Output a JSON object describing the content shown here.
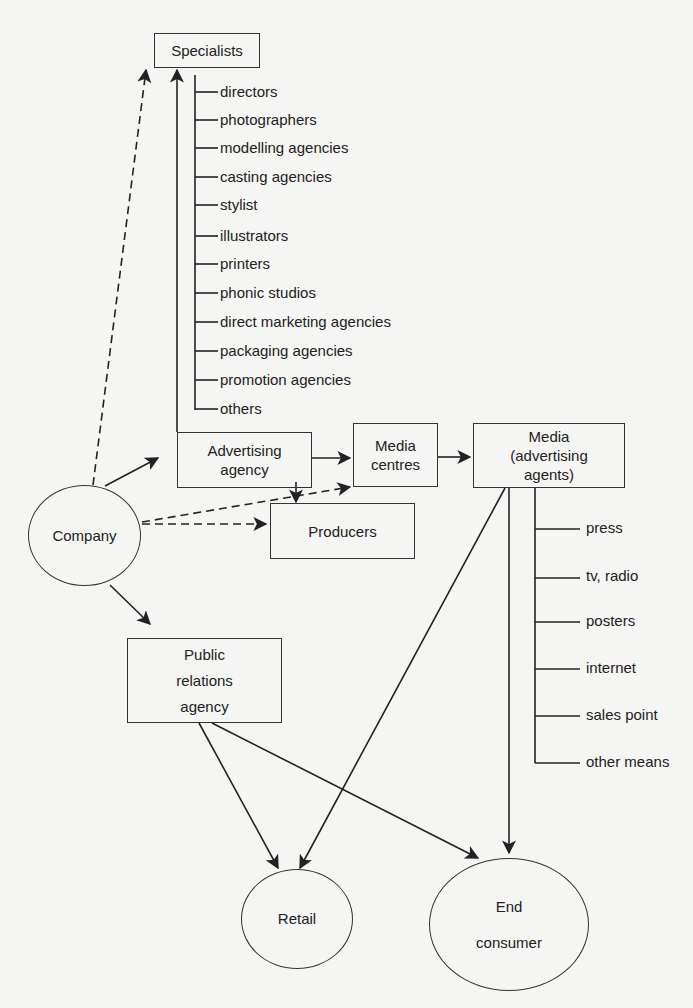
{
  "diagram": {
    "nodes": {
      "specialists": "Specialists",
      "advertising_agency": "Advertising\nagency",
      "media_centres": "Media\ncentres",
      "media_agents": "Media\n(advertising\nagents)",
      "producers": "Producers",
      "company": "Company",
      "public_relations": "Public\nrelations\nagency",
      "retail": "Retail",
      "end_consumer": "End\nconsumer"
    },
    "specialists_list": [
      "directors",
      "photographers",
      "modelling agencies",
      "casting agencies",
      "stylist",
      "illustrators",
      "printers",
      "phonic studios",
      "direct marketing agencies",
      "packaging agencies",
      "promotion agencies",
      "others"
    ],
    "media_list": [
      "press",
      "tv, radio",
      "posters",
      "internet",
      "sales point",
      "other means"
    ],
    "edges": [
      {
        "from": "company",
        "to": "specialists",
        "style": "dashed"
      },
      {
        "from": "advertising_agency",
        "to": "specialists",
        "style": "solid"
      },
      {
        "from": "company",
        "to": "advertising_agency",
        "style": "solid"
      },
      {
        "from": "company",
        "to": "media_centres",
        "style": "dashed"
      },
      {
        "from": "company",
        "to": "producers",
        "style": "dashed"
      },
      {
        "from": "company",
        "to": "public_relations",
        "style": "solid"
      },
      {
        "from": "advertising_agency",
        "to": "media_centres",
        "style": "solid"
      },
      {
        "from": "advertising_agency",
        "to": "producers",
        "style": "solid"
      },
      {
        "from": "media_centres",
        "to": "media_agents",
        "style": "solid"
      },
      {
        "from": "media_agents",
        "to": "retail",
        "style": "solid"
      },
      {
        "from": "media_agents",
        "to": "end_consumer",
        "style": "solid"
      },
      {
        "from": "public_relations",
        "to": "retail",
        "style": "solid"
      },
      {
        "from": "public_relations",
        "to": "end_consumer",
        "style": "solid"
      }
    ],
    "colors": {
      "line": "#222222",
      "background": "#f5f5f3"
    }
  }
}
